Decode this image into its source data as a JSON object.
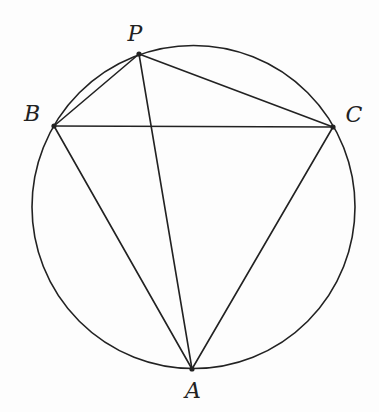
{
  "diagram": {
    "type": "inscribed-quadrilateral",
    "stroke_color": "#222222",
    "background_color": "#fdfdfd",
    "circle": {
      "cx": 193.5,
      "cy": 207,
      "r": 161.5
    },
    "points": [
      {
        "id": "P",
        "label": "P",
        "x": 139,
        "y": 54,
        "label_x": 135,
        "label_y": 34
      },
      {
        "id": "B",
        "label": "B",
        "x": 54,
        "y": 126,
        "label_x": 32,
        "label_y": 114
      },
      {
        "id": "C",
        "label": "C",
        "x": 333,
        "y": 127,
        "label_x": 354,
        "label_y": 115
      },
      {
        "id": "A",
        "label": "A",
        "x": 192,
        "y": 369,
        "label_x": 193,
        "label_y": 391
      }
    ],
    "segments": [
      [
        "P",
        "B"
      ],
      [
        "P",
        "C"
      ],
      [
        "P",
        "A"
      ],
      [
        "B",
        "C"
      ],
      [
        "B",
        "A"
      ],
      [
        "C",
        "A"
      ]
    ]
  },
  "labels": {
    "P": "P",
    "B": "B",
    "C": "C",
    "A": "A"
  }
}
